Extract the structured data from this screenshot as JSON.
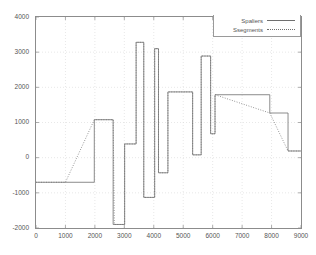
{
  "chart_data": {
    "type": "line",
    "title": "",
    "xlabel": "",
    "ylabel": "",
    "xlim": [
      0,
      9000
    ],
    "ylim": [
      -2000,
      4000
    ],
    "xticks": [
      0,
      1000,
      2000,
      3000,
      4000,
      5000,
      6000,
      7000,
      8000,
      9000
    ],
    "yticks": [
      -2000,
      -1000,
      0,
      1000,
      2000,
      3000,
      4000
    ],
    "xtick_labels": [
      "0",
      "1000",
      "2000",
      "3000",
      "4000",
      "5000",
      "6000",
      "7000",
      "8000",
      "9000"
    ],
    "ytick_labels": [
      "-2000",
      "-1000",
      "0",
      "1000",
      "2000",
      "3000",
      "4000"
    ],
    "grid": true,
    "legend_position": "top-right",
    "series": [
      {
        "name": "Spaliers",
        "style": "solid",
        "color": "#6f6f6f",
        "step": true,
        "points": [
          [
            0,
            -700
          ],
          [
            1980,
            -700
          ],
          [
            1980,
            1080
          ],
          [
            2620,
            1080
          ],
          [
            2620,
            -1900
          ],
          [
            3010,
            -1900
          ],
          [
            3010,
            390
          ],
          [
            3400,
            390
          ],
          [
            3400,
            3280
          ],
          [
            3660,
            3280
          ],
          [
            3660,
            -1130
          ],
          [
            4030,
            -1130
          ],
          [
            4030,
            3100
          ],
          [
            4160,
            3100
          ],
          [
            4160,
            -430
          ],
          [
            4480,
            -430
          ],
          [
            4480,
            1870
          ],
          [
            5320,
            1870
          ],
          [
            5320,
            80
          ],
          [
            5610,
            80
          ],
          [
            5610,
            2890
          ],
          [
            5930,
            2890
          ],
          [
            5930,
            680
          ],
          [
            6080,
            680
          ],
          [
            6080,
            1790
          ],
          [
            7940,
            1790
          ],
          [
            7940,
            1270
          ],
          [
            8560,
            1270
          ],
          [
            8560,
            190
          ],
          [
            9000,
            190
          ]
        ]
      },
      {
        "name": "Ssegments",
        "style": "dotted",
        "color": "#6f6f6f",
        "step": false,
        "points": [
          [
            0,
            -700
          ],
          [
            1000,
            -700
          ],
          [
            1980,
            1080
          ],
          [
            2620,
            1080
          ],
          [
            2660,
            -1900
          ],
          [
            3010,
            -1900
          ],
          [
            3010,
            390
          ],
          [
            3400,
            390
          ],
          [
            3400,
            3280
          ],
          [
            3660,
            3280
          ],
          [
            3660,
            -1130
          ],
          [
            4030,
            -1130
          ],
          [
            4030,
            3100
          ],
          [
            4160,
            3100
          ],
          [
            4160,
            -430
          ],
          [
            4480,
            -430
          ],
          [
            4480,
            1870
          ],
          [
            5320,
            1870
          ],
          [
            5320,
            80
          ],
          [
            5610,
            80
          ],
          [
            5610,
            2890
          ],
          [
            5930,
            2890
          ],
          [
            5930,
            680
          ],
          [
            6080,
            680
          ],
          [
            6080,
            1790
          ],
          [
            7940,
            1270
          ],
          [
            8560,
            190
          ],
          [
            9000,
            190
          ]
        ]
      }
    ],
    "legend": [
      {
        "label": "Spaliers",
        "style": "solid"
      },
      {
        "label": "Ssegments",
        "style": "dotted"
      }
    ]
  }
}
